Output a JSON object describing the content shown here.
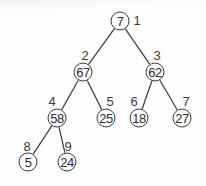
{
  "diagram": {
    "type": "binary-heap-tree",
    "nodes": [
      {
        "index": "1",
        "value": "7",
        "x": 120,
        "y": 21,
        "lx": 137,
        "ly": 20
      },
      {
        "index": "2",
        "value": "67",
        "x": 83,
        "y": 72,
        "lx": 85,
        "ly": 55
      },
      {
        "index": "3",
        "value": "62",
        "x": 155,
        "y": 72,
        "lx": 157,
        "ly": 55
      },
      {
        "index": "4",
        "value": "58",
        "x": 57,
        "y": 118,
        "lx": 52,
        "ly": 101
      },
      {
        "index": "5",
        "value": "25",
        "x": 106,
        "y": 118,
        "lx": 110,
        "ly": 101
      },
      {
        "index": "6",
        "value": "18",
        "x": 139,
        "y": 118,
        "lx": 134,
        "ly": 101
      },
      {
        "index": "7",
        "value": "27",
        "x": 182,
        "y": 118,
        "lx": 186,
        "ly": 101
      },
      {
        "index": "8",
        "value": "5",
        "x": 28,
        "y": 162,
        "lx": 27,
        "ly": 146
      },
      {
        "index": "9",
        "value": "24",
        "x": 67,
        "y": 162,
        "lx": 68,
        "ly": 146
      }
    ],
    "edges": [
      [
        0,
        1
      ],
      [
        0,
        2
      ],
      [
        1,
        3
      ],
      [
        1,
        4
      ],
      [
        2,
        5
      ],
      [
        2,
        6
      ],
      [
        3,
        7
      ],
      [
        3,
        8
      ]
    ],
    "colors": {
      "stroke": "#3a3a3a",
      "text": "#2e2e2e",
      "background": "#fdfdfd"
    }
  }
}
